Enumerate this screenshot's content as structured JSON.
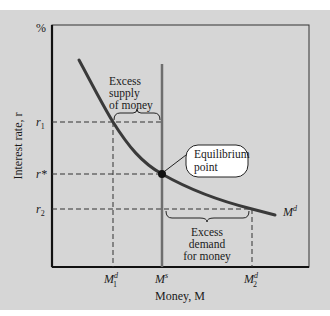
{
  "diagram": {
    "y_axis": {
      "unit_label": "%",
      "label": "Interest rate, r"
    },
    "x_axis": {
      "label": "Money, M"
    },
    "y_ticks": [
      {
        "label": "r",
        "sub": "1",
        "name": "r1"
      },
      {
        "label": "r*",
        "sub": "",
        "name": "r-star"
      },
      {
        "label": "r",
        "sub": "2",
        "name": "r2"
      }
    ],
    "x_ticks": [
      {
        "label": "M",
        "sup": "d",
        "sub": "1",
        "name": "M1d"
      },
      {
        "label": "M",
        "sup": "s",
        "sub": "",
        "name": "Ms"
      },
      {
        "label": "M",
        "sup": "d",
        "sub": "2",
        "name": "M2d"
      }
    ],
    "curves": {
      "demand_label": "M",
      "demand_sup": "d",
      "supply_label": "Ms"
    },
    "annotations": {
      "excess_supply": [
        "Excess",
        "supply",
        "of money"
      ],
      "excess_demand": [
        "Excess",
        "demand",
        "for money"
      ],
      "equilibrium": [
        "Equilibrium",
        "point"
      ]
    },
    "colors": {
      "background": "#d6d6d6",
      "axis": "#111111",
      "demand_curve": "#3a3a3a",
      "supply_line": "#6e6e6e",
      "dashed": "#333333"
    }
  }
}
